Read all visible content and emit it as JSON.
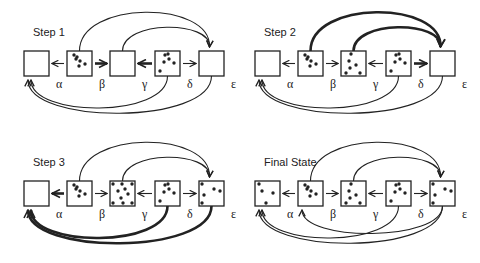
{
  "panels": [
    {
      "title": "Step 1",
      "origin": [
        0,
        0
      ],
      "labels": [
        "α",
        "β",
        "γ",
        "δ",
        "ε"
      ],
      "dots": [
        [],
        [
          [
            7,
            4
          ],
          [
            9,
            8
          ],
          [
            13,
            10
          ],
          [
            12,
            15
          ],
          [
            18,
            13
          ],
          [
            10,
            6
          ]
        ],
        [],
        [
          [
            10,
            4
          ],
          [
            14,
            8
          ],
          [
            9,
            11
          ],
          [
            19,
            12
          ],
          [
            5,
            20
          ],
          [
            13,
            3
          ]
        ],
        []
      ],
      "arrows_between": [
        {
          "from": 1,
          "to": 0,
          "weight": "thin"
        },
        {
          "from": 1,
          "to": 2,
          "weight": "bold"
        },
        {
          "from": 3,
          "to": 2,
          "weight": "bold"
        },
        {
          "from": 3,
          "to": 4,
          "weight": "thin"
        }
      ],
      "top_arcs": [
        {
          "from": 1,
          "to": 4,
          "weight": "thin"
        },
        {
          "from": 2,
          "to": 4,
          "weight": "thin"
        }
      ],
      "bottom_arcs": [
        {
          "from": 3,
          "to": 0,
          "weight": "thin"
        },
        {
          "from": 4,
          "to": 0,
          "weight": "thin"
        }
      ]
    },
    {
      "title": "Step 2",
      "origin": [
        231,
        0
      ],
      "labels": [
        "α",
        "β",
        "γ",
        "δ",
        "ε"
      ],
      "dots": [
        [],
        [
          [
            7,
            4
          ],
          [
            9,
            8
          ],
          [
            13,
            10
          ],
          [
            12,
            15
          ],
          [
            18,
            13
          ],
          [
            10,
            6
          ]
        ],
        [
          [
            10,
            3
          ],
          [
            8,
            10
          ],
          [
            15,
            14
          ],
          [
            9,
            17
          ],
          [
            5,
            22
          ],
          [
            19,
            22
          ]
        ],
        [
          [
            10,
            4
          ],
          [
            14,
            8
          ],
          [
            9,
            11
          ],
          [
            19,
            12
          ],
          [
            5,
            20
          ],
          [
            13,
            3
          ]
        ],
        []
      ],
      "arrows_between": [
        {
          "from": 1,
          "to": 0,
          "weight": "thin"
        },
        {
          "from": 1,
          "to": 2,
          "weight": "thin"
        },
        {
          "from": 3,
          "to": 2,
          "weight": "thin"
        },
        {
          "from": 3,
          "to": 4,
          "weight": "bold"
        }
      ],
      "top_arcs": [
        {
          "from": 1,
          "to": 4,
          "weight": "bold"
        },
        {
          "from": 2,
          "to": 4,
          "weight": "bold"
        }
      ],
      "bottom_arcs": [
        {
          "from": 3,
          "to": 0,
          "weight": "thin"
        },
        {
          "from": 4,
          "to": 0,
          "weight": "thin"
        }
      ]
    },
    {
      "title": "Step 3",
      "origin": [
        0,
        130
      ],
      "labels": [
        "α",
        "β",
        "γ",
        "δ",
        "ε"
      ],
      "dots": [
        [],
        [
          [
            7,
            4
          ],
          [
            9,
            8
          ],
          [
            13,
            10
          ],
          [
            12,
            15
          ],
          [
            18,
            13
          ],
          [
            10,
            6
          ]
        ],
        [
          [
            3,
            3
          ],
          [
            12,
            3
          ],
          [
            22,
            3
          ],
          [
            8,
            10
          ],
          [
            15,
            8
          ],
          [
            18,
            13
          ],
          [
            11,
            17
          ],
          [
            3,
            22
          ],
          [
            13,
            22
          ],
          [
            22,
            22
          ]
        ],
        [
          [
            10,
            4
          ],
          [
            14,
            8
          ],
          [
            9,
            11
          ],
          [
            19,
            12
          ],
          [
            5,
            20
          ],
          [
            13,
            3
          ]
        ],
        [
          [
            3,
            3
          ],
          [
            21,
            10
          ],
          [
            15,
            8
          ],
          [
            5,
            14
          ],
          [
            3,
            22
          ]
        ]
      ],
      "arrows_between": [
        {
          "from": 1,
          "to": 0,
          "weight": "bold"
        },
        {
          "from": 1,
          "to": 2,
          "weight": "thin"
        },
        {
          "from": 3,
          "to": 2,
          "weight": "thin"
        },
        {
          "from": 3,
          "to": 4,
          "weight": "thin"
        }
      ],
      "top_arcs": [
        {
          "from": 1,
          "to": 4,
          "weight": "thin"
        },
        {
          "from": 2,
          "to": 4,
          "weight": "thin"
        }
      ],
      "bottom_arcs": [
        {
          "from": 3,
          "to": 0,
          "weight": "bold"
        },
        {
          "from": 4,
          "to": 0,
          "weight": "bold"
        }
      ]
    },
    {
      "title": "Final State",
      "origin": [
        231,
        130
      ],
      "labels": [
        "α",
        "β",
        "γ",
        "δ",
        "ε"
      ],
      "dots": [
        [
          [
            4,
            3
          ],
          [
            7,
            10
          ],
          [
            18,
            12
          ],
          [
            11,
            22
          ]
        ],
        [
          [
            7,
            4
          ],
          [
            9,
            8
          ],
          [
            13,
            10
          ],
          [
            12,
            15
          ],
          [
            18,
            13
          ],
          [
            10,
            6
          ]
        ],
        [
          [
            10,
            3
          ],
          [
            8,
            10
          ],
          [
            15,
            14
          ],
          [
            9,
            17
          ],
          [
            5,
            22
          ],
          [
            19,
            22
          ]
        ],
        [
          [
            10,
            4
          ],
          [
            14,
            8
          ],
          [
            9,
            11
          ],
          [
            19,
            12
          ],
          [
            5,
            20
          ],
          [
            13,
            3
          ]
        ],
        [
          [
            3,
            3
          ],
          [
            21,
            10
          ],
          [
            15,
            8
          ],
          [
            5,
            14
          ],
          [
            3,
            22
          ]
        ]
      ],
      "arrows_between": [
        {
          "from": 1,
          "to": 0,
          "weight": "thin"
        },
        {
          "from": 1,
          "to": 2,
          "weight": "thin"
        },
        {
          "from": 3,
          "to": 2,
          "weight": "thin"
        },
        {
          "from": 3,
          "to": 4,
          "weight": "thin"
        }
      ],
      "top_arcs": [
        {
          "from": 1,
          "to": 4,
          "weight": "thin"
        },
        {
          "from": 2,
          "to": 4,
          "weight": "thin"
        }
      ],
      "bottom_arcs": [
        {
          "from": 3,
          "to": 0,
          "weight": "thin"
        },
        {
          "from": 4,
          "to": 0,
          "weight": "thin"
        },
        {
          "from": 4,
          "to": 1,
          "weight": "thin",
          "cross": true
        }
      ]
    }
  ]
}
